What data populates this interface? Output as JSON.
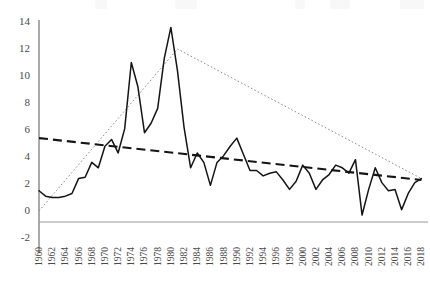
{
  "chart_data": {
    "type": "line",
    "title": "",
    "subtitle": "",
    "xlabel": "",
    "ylabel": "",
    "xlim": [
      1960,
      2019
    ],
    "ylim": [
      -2,
      14
    ],
    "ytick_step": 2,
    "xtick_step": 2,
    "grid": false,
    "legend": "none",
    "zero_line": true,
    "y_ticks": [
      "14",
      "12",
      "10",
      "8",
      "6",
      "4",
      "2",
      "0",
      "-2"
    ],
    "y_tick_values": [
      14,
      12,
      10,
      8,
      6,
      4,
      2,
      0,
      -2
    ],
    "x_ticks": [
      "1960",
      "1962",
      "1964",
      "1966",
      "1968",
      "1970",
      "1972",
      "1974",
      "1976",
      "1978",
      "1980",
      "1982",
      "1984",
      "1986",
      "1988",
      "1990",
      "1992",
      "1994",
      "1996",
      "1998",
      "2000",
      "2002",
      "2004",
      "2006",
      "2008",
      "2010",
      "2012",
      "2014",
      "2016",
      "2018"
    ],
    "x": [
      1960,
      1961,
      1962,
      1963,
      1964,
      1965,
      1966,
      1967,
      1968,
      1969,
      1970,
      1971,
      1972,
      1973,
      1974,
      1975,
      1976,
      1977,
      1978,
      1979,
      1980,
      1981,
      1982,
      1983,
      1984,
      1985,
      1986,
      1987,
      1988,
      1989,
      1990,
      1991,
      1992,
      1993,
      1994,
      1995,
      1996,
      1997,
      1998,
      1999,
      2000,
      2001,
      2002,
      2003,
      2004,
      2005,
      2006,
      2007,
      2008,
      2009,
      2010,
      2011,
      2012,
      2013,
      2014,
      2015,
      2016,
      2017,
      2018
    ],
    "series": [
      {
        "name": "annual-rate",
        "style": "solid",
        "color": "#1a1a1a",
        "values": [
          1.5,
          1.1,
          1.0,
          1.0,
          1.1,
          1.3,
          2.4,
          2.5,
          3.6,
          3.2,
          4.8,
          5.3,
          4.3,
          6.1,
          11.0,
          9.2,
          5.8,
          6.5,
          7.6,
          11.3,
          13.6,
          10.4,
          6.2,
          3.2,
          4.3,
          3.6,
          1.9,
          3.6,
          4.1,
          4.8,
          5.4,
          4.2,
          3.0,
          3.0,
          2.6,
          2.8,
          2.9,
          2.3,
          1.6,
          2.2,
          3.4,
          2.8,
          1.6,
          2.3,
          2.7,
          3.4,
          3.2,
          2.8,
          3.8,
          -0.3,
          1.6,
          3.2,
          2.1,
          1.5,
          1.6,
          0.1,
          1.3,
          2.1,
          2.4
        ]
      },
      {
        "name": "linear-trend",
        "style": "dashed",
        "color": "#1a1a1a",
        "endpoints": [
          [
            1960,
            5.4
          ],
          [
            2018,
            2.3
          ]
        ]
      },
      {
        "name": "peak-trend",
        "style": "dotted",
        "color": "#8a8a8a",
        "endpoints": [
          [
            1960,
            0.0
          ],
          [
            1981,
            12.0
          ],
          [
            2018,
            2.4
          ]
        ]
      }
    ],
    "annotations": []
  }
}
